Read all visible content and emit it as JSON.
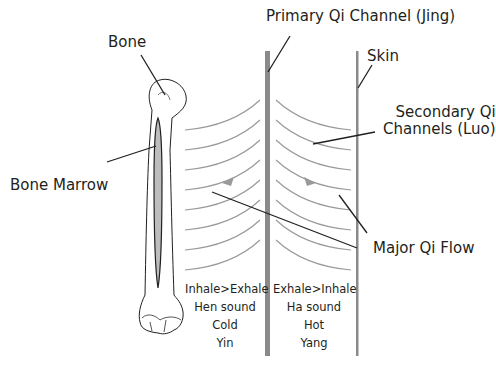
{
  "labels": {
    "bone": "Bone",
    "bone_marrow": "Bone Marrow",
    "primary_channel": "Primary Qi Channel (Jing)",
    "skin": "Skin",
    "secondary_channels_line1": "Secondary Qi",
    "secondary_channels_line2": "Channels (Luo)",
    "major_flow": "Major Qi Flow"
  },
  "inner_column": {
    "lines": [
      "Inhale>Exhale",
      "Hen sound",
      "Cold",
      "Yin"
    ]
  },
  "outer_column": {
    "lines": [
      "Exhale>Inhale",
      "Ha sound",
      "Hot",
      "Yang"
    ]
  },
  "colors": {
    "text": "#231f20",
    "channel_gray": "#8a8a8a",
    "curve_gray": "#9a9a9a",
    "marrow_fill": "#bdbdbd",
    "leader_line": "#231f20"
  }
}
